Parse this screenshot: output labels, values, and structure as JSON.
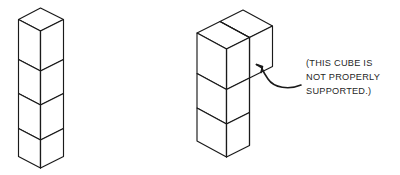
{
  "figure": {
    "stroke_color": "#1a1a1a",
    "face_color": "#ffffff",
    "background_color": "#ffffff",
    "annotation": {
      "lines": [
        "(THIS CUBE IS",
        "NOT PROPERLY",
        "SUPPORTED.)"
      ],
      "line1": "(THIS CUBE IS",
      "line2": "NOT PROPERLY",
      "line3": "SUPPORTED.)",
      "arrow_direction": "up-left",
      "arrow_target": "upper-right-cube"
    },
    "left_structure": {
      "name": "vertical-stack-of-four-cubes",
      "cube_count": 4,
      "description": "Four cubes stacked straight up in a single column, each resting fully on the one below."
    },
    "right_structure": {
      "name": "L-shaped-stack-with-overhang",
      "cube_count": 4,
      "column_cubes": 2,
      "overhang_cubes": 2,
      "description": "Two cubes stacked in a column topped by two cubes extending sideways, the outermost of which overhangs with no support beneath it."
    }
  }
}
